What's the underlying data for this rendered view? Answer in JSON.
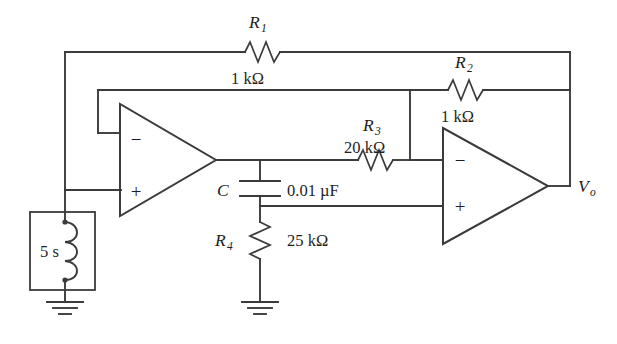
{
  "figure": {
    "type": "electronic-circuit-schematic",
    "line_color": "#3b3b3b",
    "text_color": "#1e1e1e",
    "background": "#ffffff"
  },
  "components": {
    "r1": {
      "name": "R_1",
      "name_base": "R",
      "name_sub": "1",
      "value": "1 kΩ",
      "type": "resistor"
    },
    "r2": {
      "name": "R_2",
      "name_base": "R",
      "name_sub": "2",
      "value": "1 kΩ",
      "type": "resistor"
    },
    "r3": {
      "name": "R_3",
      "name_base": "R",
      "name_sub": "3",
      "value": "20 kΩ",
      "type": "resistor"
    },
    "r4": {
      "name": "R_4",
      "name_base": "R",
      "name_sub": "4",
      "value": "25 kΩ",
      "type": "resistor"
    },
    "c": {
      "name": "C",
      "name_base": "C",
      "value": "0.01 µF",
      "type": "capacitor"
    },
    "source": {
      "name": "5 s",
      "value": "5 s",
      "type": "inductor-impedance-block"
    },
    "opamp1": {
      "name": "op-amp-1",
      "inverting_sign": "−",
      "noninverting_sign": "+"
    },
    "opamp2": {
      "name": "op-amp-2",
      "inverting_sign": "−",
      "noninverting_sign": "+"
    },
    "output": {
      "name": "V_o",
      "name_base": "V",
      "name_sub": "o"
    }
  },
  "grounds": [
    {
      "name": "ground-source"
    },
    {
      "name": "ground-r4"
    }
  ]
}
